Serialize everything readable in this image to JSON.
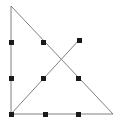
{
  "figure": {
    "canvas": {
      "width": 122,
      "height": 122,
      "background": "#ffffff"
    },
    "style": {
      "line_color": "#808080",
      "line_width": 1,
      "point_color": "#1a1a1a",
      "point_size": 5,
      "point_shape": "square"
    },
    "vertices": {
      "top_left": {
        "label": "A",
        "x": 11,
        "y": 6
      },
      "bottom_left": {
        "label": "B",
        "x": 11,
        "y": 114
      },
      "bottom_right": {
        "label": "C",
        "x": 113,
        "y": 114
      },
      "cevian_top": {
        "label": "D",
        "x": 79,
        "y": 40
      }
    },
    "segments": [
      {
        "name": "left-leg",
        "from": "top_left",
        "x1": 11,
        "y1": 6,
        "x2": 11,
        "y2": 114
      },
      {
        "name": "bottom-leg",
        "from": "bottom_left",
        "x1": 11,
        "y1": 114,
        "x2": 113,
        "y2": 114
      },
      {
        "name": "hypotenuse",
        "from": "top_left",
        "x1": 11,
        "y1": 6,
        "x2": 113,
        "y2": 114
      },
      {
        "name": "cevian",
        "from": "bottom_left",
        "x1": 11,
        "y1": 114,
        "x2": 79,
        "y2": 40
      }
    ],
    "points": [
      {
        "name": "point-left-upper",
        "on": "left-leg",
        "x": 11,
        "y": 42
      },
      {
        "name": "point-left-lower",
        "on": "left-leg",
        "x": 11,
        "y": 78
      },
      {
        "name": "point-bottom-left-vertex",
        "on": "corner",
        "x": 11,
        "y": 114
      },
      {
        "name": "point-bottom-mid-left",
        "on": "bottom-leg",
        "x": 45,
        "y": 114
      },
      {
        "name": "point-bottom-mid-right",
        "on": "bottom-leg",
        "x": 78,
        "y": 114
      },
      {
        "name": "point-hypotenuse-upper",
        "on": "hypotenuse",
        "x": 43,
        "y": 42
      },
      {
        "name": "point-hypotenuse-lower",
        "on": "hypotenuse",
        "x": 78,
        "y": 78
      },
      {
        "name": "point-cevian-lower",
        "on": "cevian",
        "x": 43,
        "y": 78
      },
      {
        "name": "point-cevian-top",
        "on": "cevian",
        "x": 79,
        "y": 40
      }
    ],
    "intersection": {
      "name": "crossing-point",
      "x": 61,
      "y": 60,
      "marked": false
    }
  }
}
